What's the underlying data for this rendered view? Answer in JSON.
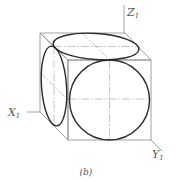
{
  "figure": {
    "caption": "(b)",
    "axes": {
      "z": {
        "letter": "Z",
        "subscript": "1"
      },
      "x": {
        "letter": "X",
        "subscript": "1"
      },
      "y": {
        "letter": "Y",
        "subscript": "1"
      }
    },
    "colors": {
      "edge": "#8a8a8a",
      "ellipse": "#2a2a2a",
      "centerline": "#9a9a9a",
      "label": "#555555",
      "background": "#ffffff"
    }
  }
}
